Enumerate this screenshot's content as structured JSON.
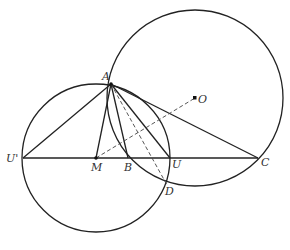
{
  "diagram": {
    "type": "geometry",
    "points": {
      "A": {
        "label": "A",
        "x": 111,
        "y": 84
      },
      "O": {
        "label": "O",
        "x": 195,
        "y": 98
      },
      "U_prime": {
        "label": "U'",
        "x": 23,
        "y": 158
      },
      "M": {
        "label": "M",
        "x": 96,
        "y": 158
      },
      "B": {
        "label": "B",
        "x": 128,
        "y": 158
      },
      "U": {
        "label": "U",
        "x": 170,
        "y": 158
      },
      "C": {
        "label": "C",
        "x": 258,
        "y": 158
      },
      "D": {
        "label": "D",
        "x": 167,
        "y": 185
      }
    },
    "circles": [
      {
        "name": "circle-O",
        "cx": 195,
        "cy": 98,
        "r": 88
      },
      {
        "name": "circle-M",
        "cx": 96,
        "cy": 158,
        "r": 74
      }
    ],
    "segments": [
      {
        "from": "U_prime",
        "to": "C",
        "style": "solid"
      },
      {
        "from": "A",
        "to": "U_prime",
        "style": "solid"
      },
      {
        "from": "A",
        "to": "M",
        "style": "solid"
      },
      {
        "from": "A",
        "to": "B",
        "style": "solid"
      },
      {
        "from": "A",
        "to": "U",
        "style": "solid"
      },
      {
        "from": "A",
        "to": "C",
        "style": "solid"
      },
      {
        "from": "A",
        "to": "D",
        "style": "dashed"
      },
      {
        "from": "M",
        "to": "O",
        "style": "dashed"
      }
    ]
  }
}
